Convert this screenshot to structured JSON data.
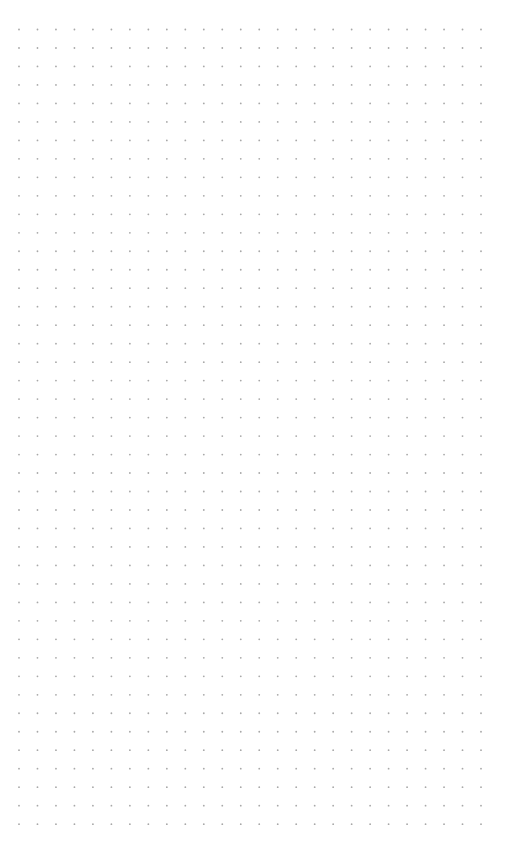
{
  "page": {
    "background": "#ffffff"
  },
  "dot_grid": {
    "dot_color": "#a8a8a8",
    "dot_radius": 0.9,
    "origin_x": 19,
    "origin_y": 29.5,
    "spacing_x": 18.48,
    "spacing_y": 18.48,
    "columns": 26,
    "rows": 44
  }
}
